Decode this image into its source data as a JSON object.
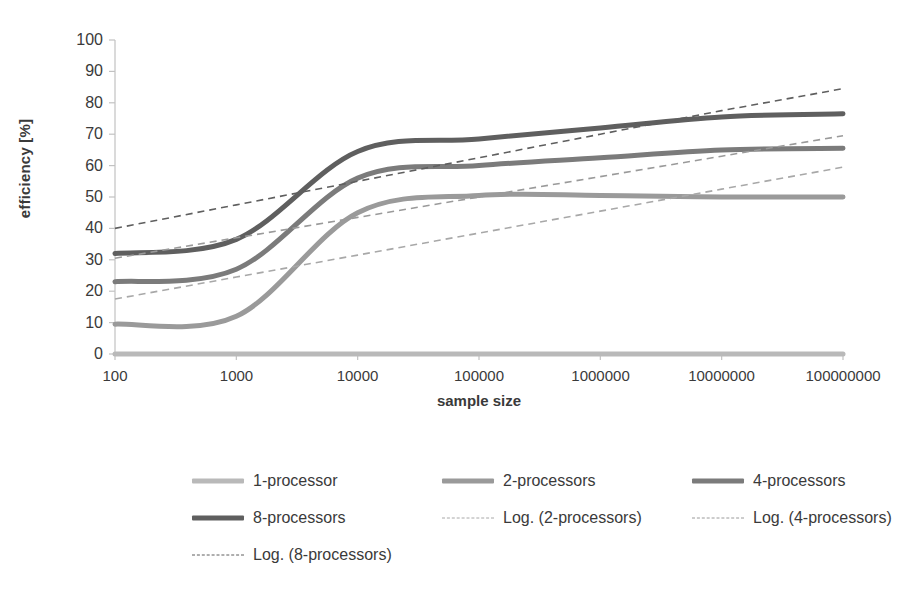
{
  "chart_data": {
    "type": "line",
    "title": "",
    "xlabel": "sample size",
    "ylabel": "efficiency [%]",
    "xscale": "log",
    "xlim": [
      100,
      100000000
    ],
    "ylim": [
      0,
      100
    ],
    "ytick_step": 10,
    "grid": false,
    "legend_position": "bottom",
    "x_ticks": [
      "100",
      "1000",
      "10000",
      "100000",
      "1000000",
      "10000000",
      "100000000"
    ],
    "x": [
      100,
      1000,
      10000,
      100000,
      1000000,
      10000000,
      100000000
    ],
    "y_ticks": [
      "0",
      "10",
      "20",
      "30",
      "40",
      "50",
      "60",
      "70",
      "80",
      "90",
      "100"
    ],
    "series": [
      {
        "name": "1-processor",
        "style": "solid",
        "color": "#b9b9b9",
        "width": 5,
        "values": [
          0,
          0,
          0,
          0,
          0,
          0,
          0
        ]
      },
      {
        "name": "2-processors",
        "style": "solid",
        "color": "#9a9a9a",
        "width": 5,
        "values": [
          9.5,
          12,
          45,
          50.5,
          50.5,
          50,
          50
        ]
      },
      {
        "name": "4-processors",
        "style": "solid",
        "color": "#7b7b7b",
        "width": 5,
        "values": [
          23,
          27,
          56,
          60,
          62.5,
          65,
          65.5
        ]
      },
      {
        "name": "8-processors",
        "style": "solid",
        "color": "#5f5f5f",
        "width": 5,
        "values": [
          32,
          36.5,
          64.5,
          68.5,
          72,
          75.5,
          76.5
        ]
      },
      {
        "name": "Log. (2-processors)",
        "style": "dashed",
        "color": "#a8a8a8",
        "width": 1.6,
        "values": [
          17.5,
          24.5,
          31.5,
          38.5,
          45.5,
          52.5,
          59.5
        ]
      },
      {
        "name": "Log. (4-processors)",
        "style": "dashed",
        "color": "#9a9a9a",
        "width": 1.6,
        "values": [
          30.5,
          37,
          43.5,
          50,
          56.5,
          63,
          69.5
        ]
      },
      {
        "name": "Log. (8-processors)",
        "style": "dashed",
        "color": "#5f5f5f",
        "width": 1.6,
        "values": [
          40,
          47.5,
          55,
          62.5,
          70,
          77.5,
          84.5
        ]
      }
    ]
  },
  "axes": {
    "y_title": "efficiency [%]",
    "x_title": "sample size"
  },
  "legend": {
    "rows": [
      [
        {
          "label": "1-processor",
          "style": "solid",
          "color": "#b9b9b9"
        },
        {
          "label": "2-processors",
          "style": "solid",
          "color": "#9a9a9a"
        },
        {
          "label": "4-processors",
          "style": "solid",
          "color": "#7b7b7b"
        }
      ],
      [
        {
          "label": "8-processors",
          "style": "solid",
          "color": "#5f5f5f"
        },
        {
          "label": "Log. (2-processors)",
          "style": "dashed",
          "color": "#a8a8a8"
        },
        {
          "label": "Log. (4-processors)",
          "style": "dashed",
          "color": "#9a9a9a"
        }
      ],
      [
        {
          "label": "Log. (8-processors)",
          "style": "dashed",
          "color": "#5f5f5f"
        }
      ]
    ]
  }
}
